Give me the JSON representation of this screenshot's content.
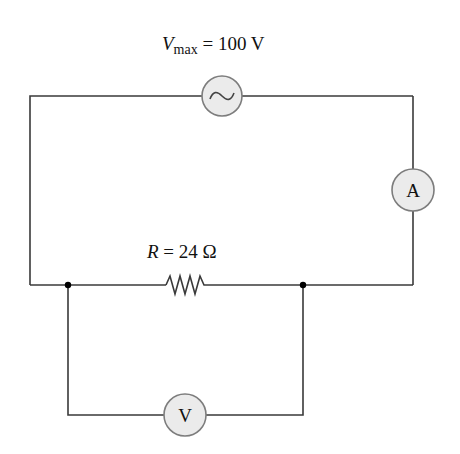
{
  "diagram": {
    "type": "circuit",
    "source": {
      "label_var": "V",
      "label_sub": "max",
      "label_rest": " = 100 V",
      "symbol": "ac-source-icon",
      "value": 100,
      "unit": "V"
    },
    "resistor": {
      "label_var": "R",
      "label_rest": " = 24 Ω",
      "value": 24,
      "unit": "Ω"
    },
    "ammeter": {
      "letter": "A"
    },
    "voltmeter": {
      "letter": "V"
    },
    "colors": {
      "wire": "#3a3a3a",
      "meter_fill": "#ebebeb",
      "meter_stroke": "#7d7d7d",
      "text": "#111111"
    }
  }
}
